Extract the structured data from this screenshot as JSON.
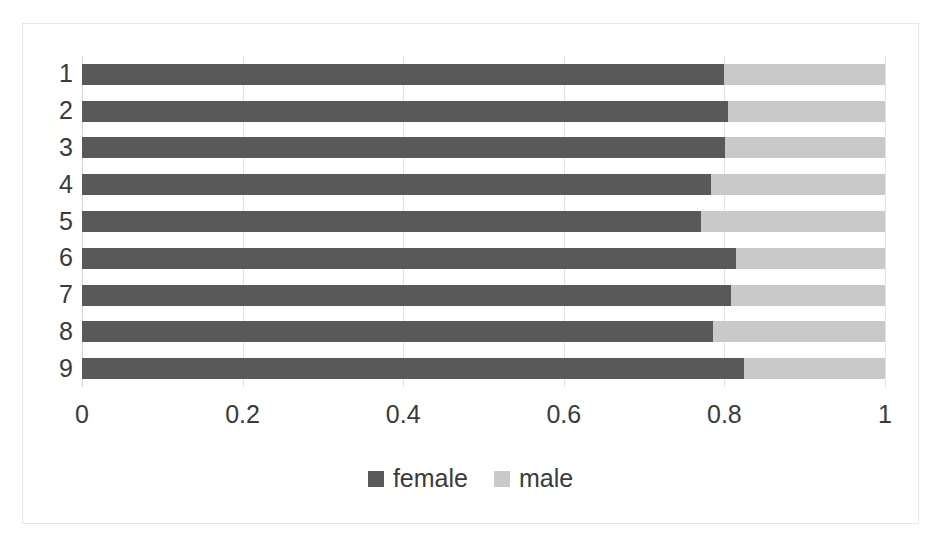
{
  "chart_data": {
    "type": "bar",
    "orientation": "horizontal",
    "stacked": true,
    "normalized": true,
    "title": "",
    "xlabel": "",
    "ylabel": "",
    "xlim": [
      0,
      1
    ],
    "xticks": [
      "0",
      "0.2",
      "0.4",
      "0.6",
      "0.8",
      "1"
    ],
    "xtick_values": [
      0,
      0.2,
      0.4,
      0.6,
      0.8,
      1
    ],
    "grid": true,
    "legend_position": "bottom",
    "categories": [
      "1",
      "2",
      "3",
      "4",
      "5",
      "6",
      "7",
      "8",
      "9"
    ],
    "series": [
      {
        "name": "female",
        "color": "#595959",
        "values": [
          0.8,
          0.805,
          0.801,
          0.783,
          0.771,
          0.815,
          0.808,
          0.786,
          0.824
        ]
      },
      {
        "name": "male",
        "color": "#c9c9c9",
        "values": [
          0.2,
          0.195,
          0.199,
          0.217,
          0.229,
          0.185,
          0.192,
          0.214,
          0.176
        ]
      }
    ]
  },
  "legend": {
    "items": [
      {
        "label": "female",
        "color": "#595959"
      },
      {
        "label": "male",
        "color": "#c9c9c9"
      }
    ]
  },
  "colors": {
    "female": "#595959",
    "male": "#c9c9c9",
    "gridline": "#e4e4e4",
    "border": "#e8e8e8",
    "text": "#3a3a3a",
    "background": "#ffffff"
  }
}
